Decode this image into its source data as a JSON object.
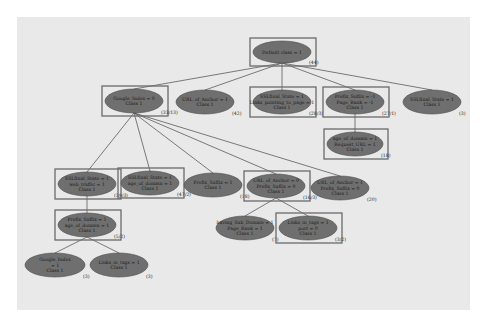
{
  "diagram": {
    "type": "decision-tree",
    "colors": {
      "background": "#e9e9e9",
      "node_fill": "#6f6f6f",
      "node_stroke": "#4a4a4a",
      "highlight_box": "#6a6a6a",
      "edge": "#5a5a5a"
    },
    "nodes": [
      {
        "id": "root",
        "lines": [
          "Default class = 1"
        ],
        "count": "(44)",
        "cx": 282,
        "cy": 52,
        "rx": 29,
        "ry": 11,
        "boxed": true
      },
      {
        "id": "n1",
        "lines": [
          "Google_Index = 0",
          "Class 1"
        ],
        "count": "(33/13)",
        "cx": 134,
        "cy": 101,
        "rx": 29,
        "ry": 12,
        "boxed": true
      },
      {
        "id": "n2",
        "lines": [
          "URL_of_Anchor = 1",
          "Class 1"
        ],
        "count": "(42)",
        "cx": 205,
        "cy": 102,
        "rx": 29,
        "ry": 12,
        "boxed": false
      },
      {
        "id": "n3",
        "lines": [
          "SSLfinal_State = 1",
          "Links_pointing_to_page = 1",
          "Class 1"
        ],
        "count": "(28/3)",
        "cx": 282,
        "cy": 102,
        "rx": 29,
        "ry": 12,
        "boxed": true
      },
      {
        "id": "n4",
        "lines": [
          "Prefix_Suffix = -1",
          "Page_Rank = -1",
          "Class 1"
        ],
        "count": "(27/1)",
        "cx": 355,
        "cy": 102,
        "rx": 29,
        "ry": 12,
        "boxed": true
      },
      {
        "id": "n5",
        "lines": [
          "SSLfinal_State = 1",
          "Class 1"
        ],
        "count": "(3)",
        "cx": 432,
        "cy": 102,
        "rx": 29,
        "ry": 12,
        "boxed": false
      },
      {
        "id": "n6",
        "lines": [
          "age_of_domain = 1",
          "Request_URL = 1",
          "Class 1"
        ],
        "count": "(18)",
        "cx": 355,
        "cy": 144,
        "rx": 28,
        "ry": 12,
        "boxed": true
      },
      {
        "id": "n7",
        "lines": [
          "SSLfinal_State = 1",
          "web_traffic = 1",
          "Class 1"
        ],
        "count": "(39/3)",
        "cx": 87,
        "cy": 184,
        "rx": 29,
        "ry": 12,
        "boxed": true
      },
      {
        "id": "n8",
        "lines": [
          "SSLfinal_State = 1",
          "age_of_domain = 1",
          "Class 1"
        ],
        "count": "(47/2)",
        "cx": 150,
        "cy": 183,
        "rx": 29,
        "ry": 12,
        "boxed": true
      },
      {
        "id": "n9",
        "lines": [
          "Prefix_Suffix = 1",
          "Class 1"
        ],
        "count": "(18)",
        "cx": 213,
        "cy": 185,
        "rx": 29,
        "ry": 12,
        "boxed": false
      },
      {
        "id": "n10",
        "lines": [
          "URL_of_Anchor = 0",
          "Prefix_Suffix = 0",
          "Class 1"
        ],
        "count": "(16/3)",
        "cx": 276,
        "cy": 186,
        "rx": 29,
        "ry": 12,
        "boxed": true
      },
      {
        "id": "n11",
        "lines": [
          "URL_of_Anchor = 1",
          "Prefix_Suffix = 0",
          "Class 1"
        ],
        "count": "(20)",
        "cx": 340,
        "cy": 188,
        "rx": 29,
        "ry": 12,
        "boxed": false
      },
      {
        "id": "n12",
        "lines": [
          "Prefix_Suffix = 1",
          "age_of_domain = 1",
          "Class 1"
        ],
        "count": "(5/2)",
        "cx": 87,
        "cy": 225,
        "rx": 29,
        "ry": 12,
        "boxed": true
      },
      {
        "id": "n13",
        "lines": [
          "having_Sub_Domain = 1",
          "Page_Rank = 1",
          "Class 1"
        ],
        "count": "(7)",
        "cx": 245,
        "cy": 228,
        "rx": 29,
        "ry": 12,
        "boxed": false
      },
      {
        "id": "n14",
        "lines": [
          "Links_in_tags = 1",
          "port = 0",
          "Class 1"
        ],
        "count": "(3/2)",
        "cx": 308,
        "cy": 228,
        "rx": 29,
        "ry": 12,
        "boxed": true
      },
      {
        "id": "n15",
        "lines": [
          "Google_Index",
          "= 1",
          "Class 1"
        ],
        "count": "(3)",
        "cx": 55,
        "cy": 265,
        "rx": 30,
        "ry": 12,
        "boxed": false
      },
      {
        "id": "n16",
        "lines": [
          "Links_in_tags = 1",
          "Class 1"
        ],
        "count": "(3)",
        "cx": 119,
        "cy": 265,
        "rx": 29,
        "ry": 12,
        "boxed": false
      }
    ],
    "edges": [
      [
        "root",
        "n1"
      ],
      [
        "root",
        "n2"
      ],
      [
        "root",
        "n3"
      ],
      [
        "root",
        "n4"
      ],
      [
        "root",
        "n5"
      ],
      [
        "n4",
        "n6"
      ],
      [
        "n1",
        "n7"
      ],
      [
        "n1",
        "n8"
      ],
      [
        "n1",
        "n9"
      ],
      [
        "n1",
        "n10"
      ],
      [
        "n1",
        "n11"
      ],
      [
        "n7",
        "n12"
      ],
      [
        "n10",
        "n13"
      ],
      [
        "n10",
        "n14"
      ],
      [
        "n12",
        "n15"
      ],
      [
        "n12",
        "n16"
      ]
    ]
  }
}
